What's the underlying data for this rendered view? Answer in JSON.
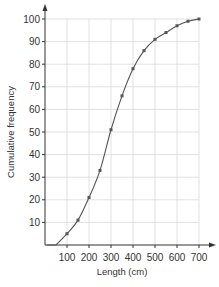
{
  "chart_data": {
    "type": "line",
    "title": "",
    "xlabel": "Length (cm)",
    "ylabel": "Cumulative frequency",
    "xlim": [
      0,
      700
    ],
    "ylim": [
      0,
      100
    ],
    "x_ticks": [
      100,
      200,
      300,
      400,
      500,
      600,
      700
    ],
    "y_ticks": [
      10,
      20,
      30,
      40,
      50,
      60,
      70,
      80,
      90,
      100
    ],
    "grid": true,
    "legend": null,
    "series": [
      {
        "name": "Cumulative frequency",
        "x": [
          50,
          100,
          150,
          200,
          250,
          300,
          350,
          400,
          450,
          500,
          550,
          600,
          650,
          700
        ],
        "y": [
          0,
          5,
          11,
          21,
          33,
          51,
          66,
          78,
          86,
          91,
          94,
          97,
          99,
          100
        ],
        "markers": [
          false,
          true,
          true,
          true,
          true,
          true,
          true,
          true,
          true,
          true,
          true,
          true,
          true,
          true
        ]
      }
    ],
    "colors": {
      "line": "#555555",
      "grid": "#d9d9d9",
      "axis": "#333333",
      "marker": "#555555"
    }
  }
}
